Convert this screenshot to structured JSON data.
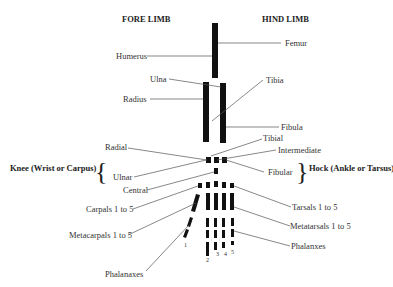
{
  "headings": {
    "fore_limb": "FORE LIMB",
    "hind_limb": "HIND LIMB"
  },
  "groups": {
    "knee": "Knee (Wrist or Carpus)",
    "hock": "Hock (Ankle or Tarsus)"
  },
  "fore_labels": {
    "humerus": "Humerus",
    "ulna": "Ulna",
    "radius": "Radius",
    "radial": "Radial",
    "ulnar": "Ulnar",
    "central": "Central",
    "carpals": "Carpals 1 to 5",
    "metacarpals": "Metacarpals 1 to 5",
    "phalanxes": "Phalanaxes"
  },
  "hind_labels": {
    "femur": "Femur",
    "tibia": "Tibia",
    "fibula": "Fibula",
    "tibial": "Tibial",
    "intermediate": "Intermediate",
    "fibular": "Fibular",
    "tarsals": "Tarsals 1 to 5",
    "metatarsals": "Metatarsals 1 to 5",
    "phalanxes": "Phalanxes"
  },
  "digits": [
    "1",
    "2",
    "3",
    "4",
    "5"
  ],
  "colors": {
    "bone": "#111111",
    "line": "#555555",
    "text": "#333333"
  }
}
